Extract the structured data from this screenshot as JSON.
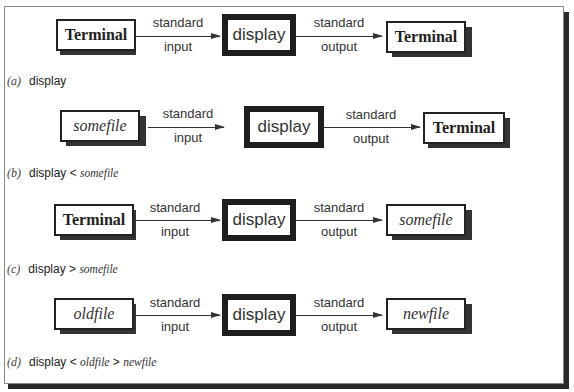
{
  "diagram": {
    "arrow_labels": {
      "input": [
        "standard",
        "input"
      ],
      "output": [
        "standard",
        "output"
      ]
    },
    "program": "display",
    "rows": [
      {
        "tag": "(a)",
        "source": {
          "label": "Terminal",
          "style": "bold"
        },
        "sink": {
          "label": "Terminal",
          "style": "bold"
        },
        "command": {
          "cmd": "display",
          "op1": "",
          "file1": "",
          "op2": "",
          "file2": ""
        }
      },
      {
        "tag": "(b)",
        "source": {
          "label": "somefile",
          "style": "italic"
        },
        "sink": {
          "label": "Terminal",
          "style": "bold"
        },
        "command": {
          "cmd": "display",
          "op1": "<",
          "file1": "somefile",
          "op2": "",
          "file2": ""
        }
      },
      {
        "tag": "(c)",
        "source": {
          "label": "Terminal",
          "style": "bold"
        },
        "sink": {
          "label": "somefile",
          "style": "italic"
        },
        "command": {
          "cmd": "display",
          "op1": ">",
          "file1": "somefile",
          "op2": "",
          "file2": ""
        }
      },
      {
        "tag": "(d)",
        "source": {
          "label": "oldfile",
          "style": "italic"
        },
        "sink": {
          "label": "newfile",
          "style": "italic"
        },
        "command": {
          "cmd": "display",
          "op1": "<",
          "file1": "oldfile",
          "op2": ">",
          "file2": "newfile"
        }
      }
    ]
  }
}
